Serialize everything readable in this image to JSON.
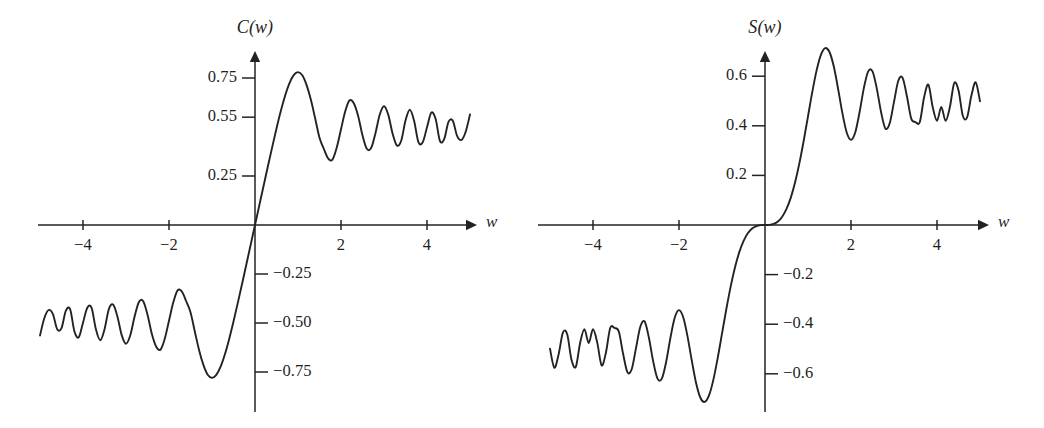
{
  "figure": {
    "background_color": "#ffffff",
    "ink_color": "#232323",
    "panels": [
      "left",
      "right"
    ]
  },
  "chart_data": [
    {
      "type": "line",
      "panel": "left",
      "title": "C(w)",
      "xlabel": "w",
      "ylabel": "C(w)",
      "grid": false,
      "legend": "none",
      "xlim": [
        -5.2,
        5.2
      ],
      "ylim": [
        -0.95,
        0.95
      ],
      "xticks": [
        -4,
        -2,
        2,
        4
      ],
      "xtick_labels": [
        "−4",
        "−2",
        "2",
        "4"
      ],
      "yticks": [
        0.75,
        0.55,
        0.25,
        -0.25,
        -0.5,
        -0.75
      ],
      "ytick_labels": [
        "0.75",
        "0.55",
        "0.25",
        "−0.25",
        "−0.50",
        "−0.75"
      ],
      "description": "Fresnel cosine integral C(w) = integral from 0 to w of cos(pi t^2 / 2) dt",
      "x": [
        -5.0,
        -4.9,
        -4.8,
        -4.7,
        -4.6,
        -4.5,
        -4.4,
        -4.3,
        -4.2,
        -4.1,
        -4.0,
        -3.9,
        -3.8,
        -3.7,
        -3.6,
        -3.5,
        -3.4,
        -3.3,
        -3.2,
        -3.1,
        -3.0,
        -2.9,
        -2.8,
        -2.7,
        -2.6,
        -2.5,
        -2.4,
        -2.3,
        -2.2,
        -2.1,
        -2.0,
        -1.9,
        -1.8,
        -1.7,
        -1.6,
        -1.5,
        -1.4,
        -1.3,
        -1.2,
        -1.1,
        -1.0,
        -0.9,
        -0.8,
        -0.7,
        -0.6,
        -0.5,
        -0.4,
        -0.3,
        -0.2,
        -0.1,
        0.0,
        0.1,
        0.2,
        0.3,
        0.4,
        0.5,
        0.6,
        0.7,
        0.8,
        0.9,
        1.0,
        1.1,
        1.2,
        1.3,
        1.4,
        1.5,
        1.6,
        1.7,
        1.8,
        1.9,
        2.0,
        2.1,
        2.2,
        2.3,
        2.4,
        2.5,
        2.6,
        2.7,
        2.8,
        2.9,
        3.0,
        3.1,
        3.2,
        3.3,
        3.4,
        3.5,
        3.6,
        3.7,
        3.8,
        3.9,
        4.0,
        4.1,
        4.2,
        4.3,
        4.4,
        4.5,
        4.6,
        4.7,
        4.8,
        4.9,
        5.0
      ],
      "y": [
        -0.5636,
        -0.476,
        -0.4338,
        -0.4545,
        -0.5319,
        -0.5261,
        -0.4383,
        -0.4294,
        -0.5418,
        -0.5736,
        -0.4984,
        -0.422,
        -0.4229,
        -0.5322,
        -0.588,
        -0.5326,
        -0.4296,
        -0.4057,
        -0.4663,
        -0.5619,
        -0.6058,
        -0.5624,
        -0.4674,
        -0.3926,
        -0.3889,
        -0.4574,
        -0.555,
        -0.6197,
        -0.6363,
        -0.5815,
        -0.4883,
        -0.3945,
        -0.3336,
        -0.3398,
        -0.389,
        -0.4453,
        -0.5431,
        -0.6386,
        -0.7135,
        -0.7638,
        -0.7799,
        -0.7648,
        -0.723,
        -0.6597,
        -0.5811,
        -0.4923,
        -0.3975,
        -0.2994,
        -0.1999,
        -0.1,
        0.0,
        0.1,
        0.1999,
        0.2994,
        0.3975,
        0.4923,
        0.5811,
        0.6597,
        0.723,
        0.7648,
        0.7799,
        0.7638,
        0.7135,
        0.6386,
        0.5431,
        0.4453,
        0.389,
        0.3398,
        0.3336,
        0.3945,
        0.4883,
        0.5815,
        0.6363,
        0.6197,
        0.555,
        0.4574,
        0.3889,
        0.3926,
        0.4674,
        0.5624,
        0.6058,
        0.5619,
        0.4663,
        0.4057,
        0.4296,
        0.5326,
        0.588,
        0.5322,
        0.4229,
        0.422,
        0.4984,
        0.5736,
        0.5418,
        0.4294,
        0.4383,
        0.5261,
        0.5319,
        0.4545,
        0.4338,
        0.476,
        0.5636
      ],
      "annotations": {
        "first_maximum": {
          "w": 1.0,
          "value": 0.78
        },
        "first_minimum_positive_side": {
          "w": 1.8,
          "value": 0.33
        },
        "limit": 0.5
      }
    },
    {
      "type": "line",
      "panel": "right",
      "title": "S(w)",
      "xlabel": "w",
      "ylabel": "S(w)",
      "grid": false,
      "legend": "none",
      "xlim": [
        -5.2,
        5.2
      ],
      "ylim": [
        -0.75,
        0.75
      ],
      "xticks": [
        -4,
        -2,
        2,
        4
      ],
      "xtick_labels": [
        "−4",
        "−2",
        "2",
        "4"
      ],
      "yticks": [
        0.6,
        0.4,
        0.2,
        -0.2,
        -0.4,
        -0.6
      ],
      "ytick_labels": [
        "0.6",
        "0.4",
        "0.2",
        "−0.2",
        "−0.4",
        "−0.6"
      ],
      "description": "Fresnel sine integral S(w) = integral from 0 to w of sin(pi t^2 / 2) dt",
      "x": [
        -5.0,
        -4.9,
        -4.8,
        -4.7,
        -4.6,
        -4.5,
        -4.4,
        -4.3,
        -4.2,
        -4.1,
        -4.0,
        -3.9,
        -3.8,
        -3.7,
        -3.6,
        -3.5,
        -3.4,
        -3.3,
        -3.2,
        -3.1,
        -3.0,
        -2.9,
        -2.8,
        -2.7,
        -2.6,
        -2.5,
        -2.4,
        -2.3,
        -2.2,
        -2.1,
        -2.0,
        -1.9,
        -1.8,
        -1.7,
        -1.6,
        -1.5,
        -1.4,
        -1.3,
        -1.2,
        -1.1,
        -1.0,
        -0.9,
        -0.8,
        -0.7,
        -0.6,
        -0.5,
        -0.4,
        -0.3,
        -0.2,
        -0.1,
        0.0,
        0.1,
        0.2,
        0.3,
        0.4,
        0.5,
        0.6,
        0.7,
        0.8,
        0.9,
        1.0,
        1.1,
        1.2,
        1.3,
        1.4,
        1.5,
        1.6,
        1.7,
        1.8,
        1.9,
        2.0,
        2.1,
        2.2,
        2.3,
        2.4,
        2.5,
        2.6,
        2.7,
        2.8,
        2.9,
        3.0,
        3.1,
        3.2,
        3.3,
        3.4,
        3.5,
        3.6,
        3.7,
        3.8,
        3.9,
        4.0,
        4.1,
        4.2,
        4.3,
        4.4,
        4.5,
        4.6,
        4.7,
        4.8,
        4.9,
        5.0
      ],
      "y": [
        -0.4992,
        -0.5752,
        -0.5219,
        -0.4339,
        -0.4405,
        -0.5437,
        -0.572,
        -0.4759,
        -0.4202,
        -0.4759,
        -0.4205,
        -0.4752,
        -0.5656,
        -0.515,
        -0.4152,
        -0.4153,
        -0.4296,
        -0.5194,
        -0.5933,
        -0.5817,
        -0.4963,
        -0.4101,
        -0.3889,
        -0.4545,
        -0.55,
        -0.6192,
        -0.6196,
        -0.553,
        -0.4557,
        -0.3741,
        -0.3434,
        -0.3733,
        -0.4509,
        -0.5492,
        -0.6389,
        -0.6975,
        -0.7135,
        -0.6863,
        -0.6234,
        -0.5365,
        -0.4383,
        -0.3397,
        -0.2493,
        -0.1721,
        -0.1105,
        -0.0647,
        -0.0334,
        -0.0141,
        -0.0042,
        -0.0005,
        0.0,
        0.0005,
        0.0042,
        0.0141,
        0.0334,
        0.0647,
        0.1105,
        0.1721,
        0.2493,
        0.3397,
        0.4383,
        0.5365,
        0.6234,
        0.6863,
        0.7135,
        0.6975,
        0.6389,
        0.5492,
        0.4509,
        0.3733,
        0.3434,
        0.3741,
        0.4557,
        0.553,
        0.6196,
        0.6192,
        0.55,
        0.4545,
        0.3889,
        0.4101,
        0.4963,
        0.5817,
        0.5933,
        0.5194,
        0.4296,
        0.4153,
        0.4152,
        0.515,
        0.5656,
        0.4752,
        0.4205,
        0.4759,
        0.4202,
        0.4759,
        0.572,
        0.5437,
        0.4405,
        0.4339,
        0.5219,
        0.5752,
        0.4992
      ],
      "annotations": {
        "first_maximum": {
          "w": 1.4,
          "value": 0.71
        },
        "first_minimum_positive_side": {
          "w": 2.0,
          "value": 0.34
        },
        "limit": 0.5
      }
    }
  ],
  "left_panel": {
    "axis_title": "C(w)",
    "x_axis_label": "w",
    "ytick_labels": [
      "0.75",
      "0.55",
      "0.25",
      "−0.25",
      "−0.50",
      "−0.75"
    ],
    "xtick_labels": [
      "−4",
      "−2",
      "2",
      "4"
    ]
  },
  "right_panel": {
    "axis_title": "S(w)",
    "x_axis_label": "w",
    "ytick_labels": [
      "0.6",
      "0.4",
      "0.2",
      "−0.2",
      "−0.4",
      "−0.6"
    ],
    "xtick_labels": [
      "−4",
      "−2",
      "2",
      "4"
    ]
  }
}
